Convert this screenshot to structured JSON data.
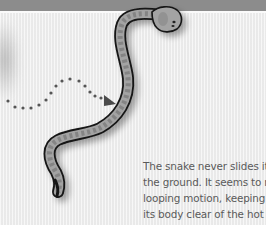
{
  "header_band": {
    "color": "#8c8c8c"
  },
  "illustration": {
    "subject": "snake",
    "icons": [
      "snake-illustration",
      "dotted-arrow-icon"
    ],
    "colors": {
      "outline": "#1a1a1a",
      "body": "#9a9a9a",
      "pattern": "#7a7a7a",
      "arrow": "#555555"
    }
  },
  "caption": {
    "lines": [
      "The snake never slides its body over",
      "the ground. It seems to move in a",
      "looping motion, keeping much of",
      "its body clear of the hot sand."
    ]
  }
}
